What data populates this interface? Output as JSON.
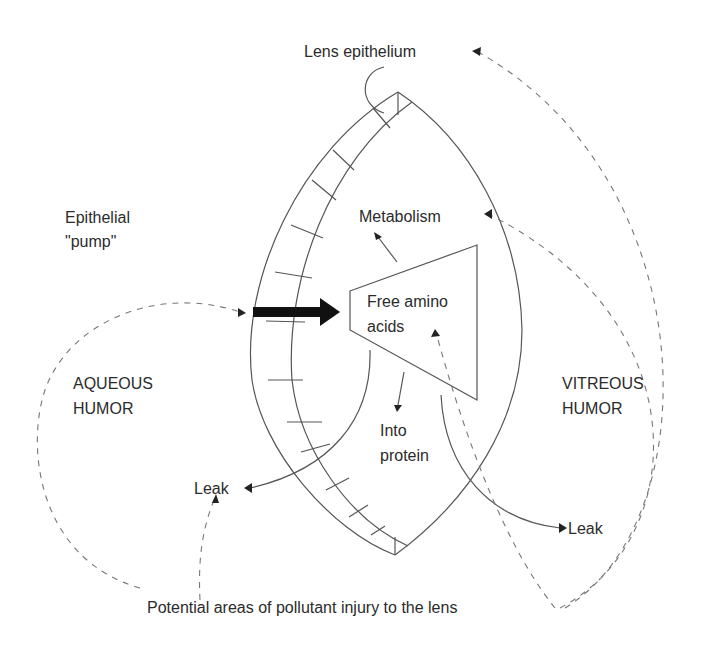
{
  "diagram": {
    "labels": {
      "lens_epithelium": "Lens epithelium",
      "epithelial_pump_line1": "Epithelial",
      "epithelial_pump_line2": "\"pump\"",
      "metabolism": "Metabolism",
      "free_amino_line1": "Free amino",
      "free_amino_line2": "acids",
      "aqueous_line1": "AQUEOUS",
      "aqueous_line2": "HUMOR",
      "vitreous_line1": "VITREOUS",
      "vitreous_line2": "HUMOR",
      "into_protein_line1": "Into",
      "into_protein_line2": "protein",
      "leak_left": "Leak",
      "leak_right": "Leak",
      "caption": "Potential areas of pollutant injury to the lens"
    },
    "colors": {
      "line": "#555555",
      "dashed": "#777777",
      "text": "#2b2b2b",
      "arrow": "#111111"
    }
  }
}
